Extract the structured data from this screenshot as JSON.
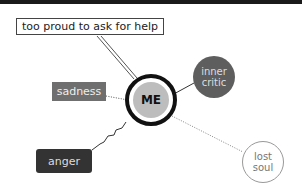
{
  "diagram": {
    "center": {
      "label": "ME"
    },
    "nodes": [
      {
        "id": "help",
        "label": "too proud to ask for help",
        "connector": "double-line"
      },
      {
        "id": "sadness",
        "label": "sadness",
        "connector": "dotted"
      },
      {
        "id": "anger",
        "label": "anger",
        "connector": "jagged"
      },
      {
        "id": "critic",
        "label": "inner critic",
        "connector": "solid"
      },
      {
        "id": "lost",
        "label": "lost soul",
        "connector": "dotted"
      }
    ]
  }
}
